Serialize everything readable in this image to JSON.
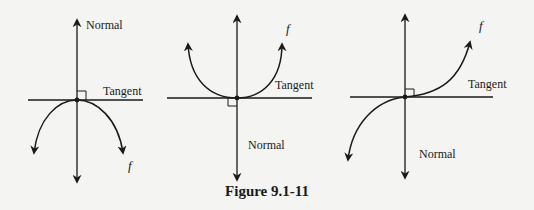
{
  "figure": {
    "caption": "Figure 9.1-11",
    "background": "#f4f4f2",
    "ink": "#1a1a1a"
  },
  "panels": [
    {
      "id": "concave-down",
      "curve_label": "f",
      "tangent_label": "Tangent",
      "normal_label": "Normal",
      "normal_direction": "up",
      "description": "Downward-opening curve with horizontal tangent at its maximum; normal points upward"
    },
    {
      "id": "concave-up",
      "curve_label": "f",
      "tangent_label": "Tangent",
      "normal_label": "Normal",
      "normal_direction": "down",
      "description": "Upward-opening curve with horizontal tangent at its minimum; normal labeled below"
    },
    {
      "id": "inflection",
      "curve_label": "f",
      "tangent_label": "Tangent",
      "normal_label": "Normal",
      "normal_direction": "down",
      "description": "Cubic-like curve with horizontal tangent at inflection point; normal labeled below"
    }
  ]
}
